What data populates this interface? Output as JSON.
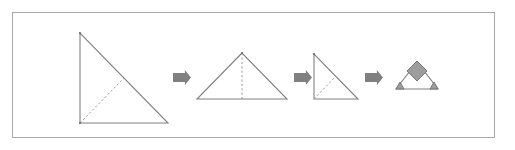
{
  "figure": {
    "background_color": "#ffffff",
    "frame": {
      "border_color": "#a8a8a8",
      "fill_color": "#ffffff",
      "x": 12,
      "y": 12,
      "width": 483,
      "height": 126
    },
    "colors": {
      "outline": "#808080",
      "fold_line": "#9a9a9a",
      "arrow": "#808080",
      "shaded_region": "#9d9d9d",
      "shaded_region_edge": "#6e6e6e"
    },
    "steps": [
      {
        "index": 1,
        "name": "large-right-triangle",
        "label": "Step 1",
        "shape_type": "right-triangle",
        "right_angle_corner": "bottom-left",
        "vertices": [
          [
            80,
            33
          ],
          [
            80,
            123
          ],
          [
            168,
            123
          ]
        ],
        "fold_lines": [
          [
            [
              80,
              123
            ],
            [
              124,
              78
            ]
          ]
        ],
        "shaded_regions": []
      },
      {
        "index": 2,
        "name": "isosceles-triangle",
        "label": "Step 2",
        "shape_type": "isosceles-triangle",
        "vertices": [
          [
            242,
            53
          ],
          [
            197,
            99
          ],
          [
            287,
            99
          ]
        ],
        "fold_lines": [
          [
            [
              242,
              53
            ],
            [
              242,
              99
            ]
          ]
        ],
        "shaded_regions": []
      },
      {
        "index": 3,
        "name": "small-right-triangle",
        "label": "Step 3",
        "shape_type": "right-triangle",
        "right_angle_corner": "bottom-left",
        "vertices": [
          [
            314,
            54
          ],
          [
            314,
            99
          ],
          [
            358,
            99
          ]
        ],
        "fold_lines": [
          [
            [
              314,
              99
            ],
            [
              336,
              76
            ]
          ]
        ],
        "shaded_regions": []
      },
      {
        "index": 4,
        "name": "folded-triangle-with-flaps",
        "label": "Step 4",
        "shape_type": "isosceles-triangle",
        "vertices": [
          [
            417,
            62
          ],
          [
            396,
            89
          ],
          [
            438,
            89
          ]
        ],
        "fold_lines": [],
        "shaded_regions": [
          {
            "name": "top-diamond-flap",
            "points": [
              [
                417,
                61
              ],
              [
                427,
                71
              ],
              [
                417,
                81
              ],
              [
                407,
                71
              ]
            ]
          },
          {
            "name": "bottom-left-flap",
            "points": [
              [
                396,
                89
              ],
              [
                404,
                89
              ],
              [
                400,
                82
              ]
            ]
          },
          {
            "name": "bottom-right-flap",
            "points": [
              [
                430,
                89
              ],
              [
                438,
                89
              ],
              [
                434,
                82
              ]
            ]
          }
        ]
      }
    ],
    "arrows": [
      {
        "name": "arrow-step-1-to-2",
        "direction": "right",
        "x": 173,
        "y": 77,
        "length": 18,
        "thickness": 9
      },
      {
        "name": "arrow-step-2-to-3",
        "direction": "right",
        "x": 294,
        "y": 77,
        "length": 18,
        "thickness": 9
      },
      {
        "name": "arrow-step-3-to-4",
        "direction": "right",
        "x": 365,
        "y": 77,
        "length": 18,
        "thickness": 9
      }
    ]
  }
}
